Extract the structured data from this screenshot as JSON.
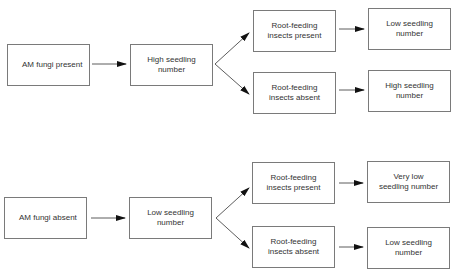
{
  "diagram": {
    "colors": {
      "line": "#333333",
      "border": "#7a7a7a",
      "text": "#333333"
    },
    "top": {
      "start": "AM fungi present",
      "middle": "High seedling\nnumber",
      "branch_upper": "Root-feeding\ninsects present",
      "branch_lower": "Root-feeding\ninsects absent",
      "outcome_upper": "Low  seedling\nnumber",
      "outcome_lower": "High seedling\nnumber"
    },
    "bottom": {
      "start": "AM fungi absent",
      "middle": "Low  seedling\nnumber",
      "branch_upper": "Root-feeding\ninsects present",
      "branch_lower": "Root-feeding\ninsects absent",
      "outcome_upper": "Very low\nseedling number",
      "outcome_lower": "Low  seedling\nnumber"
    }
  }
}
